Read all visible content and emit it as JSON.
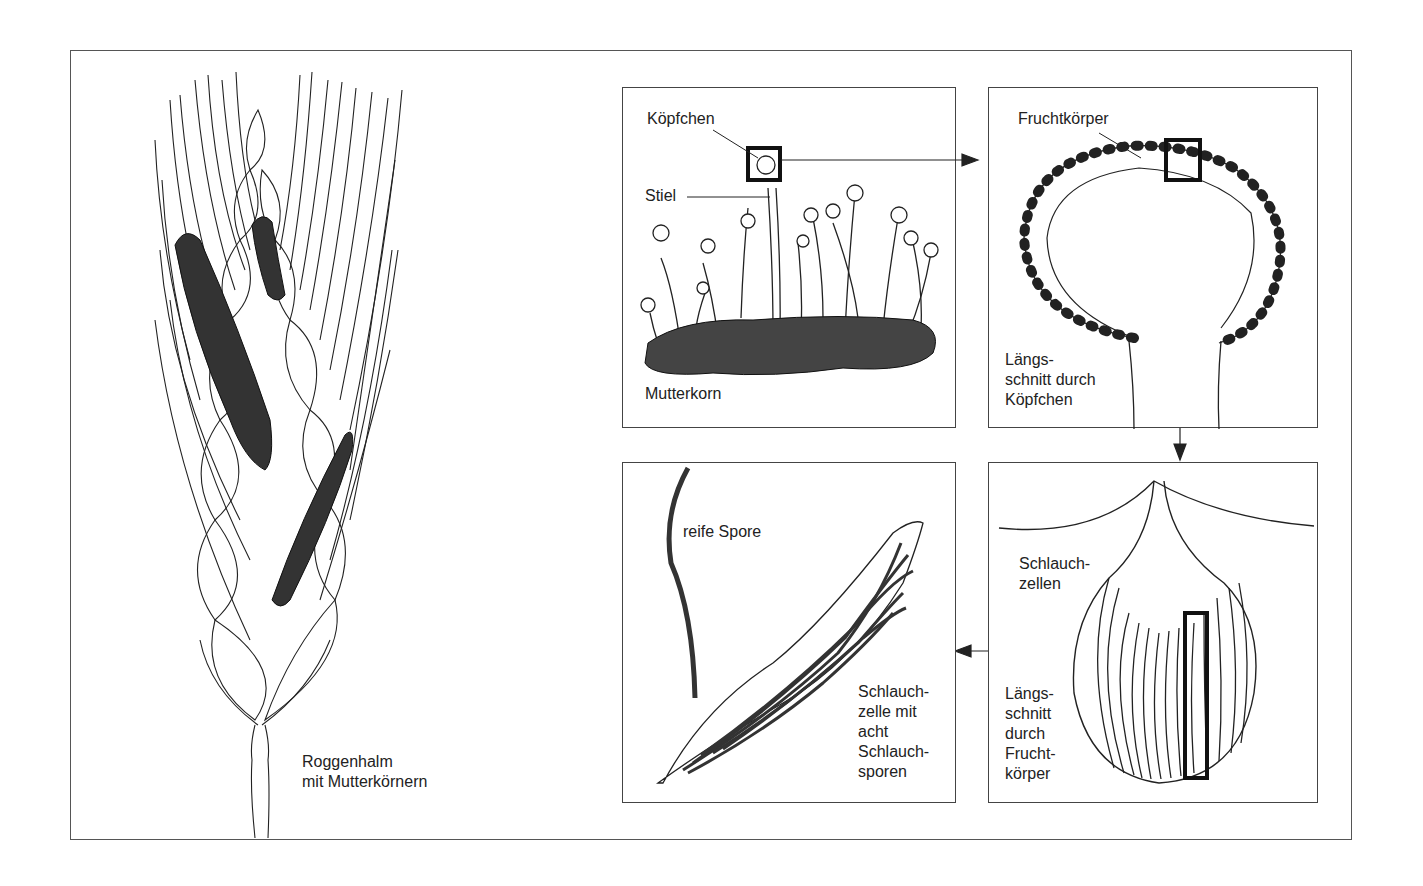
{
  "figure": {
    "main_label": "Roggenhalm\nmit Mutterkörnern",
    "panels": [
      {
        "id": "mutterkorn",
        "labels": {
          "head": "Köpfchen",
          "stalk": "Stiel",
          "body": "Mutterkorn"
        }
      },
      {
        "id": "koepfchen-section",
        "labels": {
          "fruit": "Fruchtkörper",
          "section": "Längs-\nschnitt durch\nKöpfchen"
        }
      },
      {
        "id": "fruchtkoerper-section",
        "labels": {
          "cells": "Schlauch-\nzellen",
          "section": "Längs-\nschnitt\ndurch\nFrucht-\nkörper"
        }
      },
      {
        "id": "schlauchzelle",
        "labels": {
          "spore": "reife Spore",
          "cell": "Schlauch-\nzelle mit\nacht\nSchlauch-\nsporen"
        }
      }
    ]
  }
}
